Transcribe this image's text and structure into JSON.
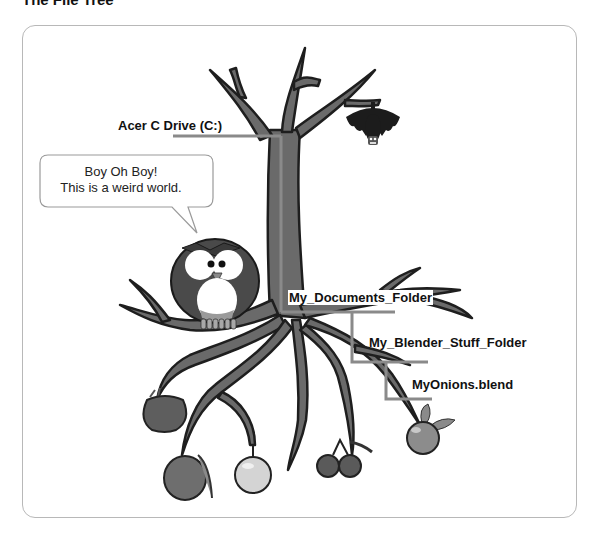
{
  "page": {
    "title": "The File Tree"
  },
  "speech_bubble": {
    "line1": "Boy Oh Boy!",
    "line2": "This is a weird world."
  },
  "tree_labels": {
    "drive": "Acer C Drive (C:)",
    "documents_folder": "My_Documents_Folder",
    "blender_folder": "My_Blender_Stuff_Folder",
    "file": "MyOnions.blend"
  },
  "characters": [
    "owl",
    "bat"
  ],
  "fruits": [
    "red-apple",
    "peach",
    "green-apple",
    "cherries",
    "orange"
  ],
  "colors": {
    "branch_fill": "#6a6a6a",
    "branch_outline": "#1e1e1e",
    "connector_line": "#8a8a8a",
    "frame_border": "#b8b8b8"
  }
}
